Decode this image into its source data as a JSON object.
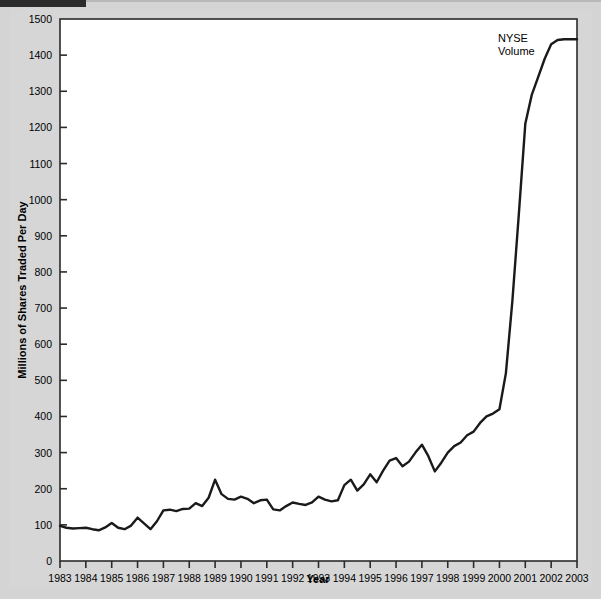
{
  "chart_data": {
    "type": "line",
    "title": "",
    "xlabel": "Year",
    "ylabel": "Millions of Shares Traded Per Day",
    "xlim": [
      1983,
      2003
    ],
    "ylim": [
      0,
      1500
    ],
    "grid": false,
    "legend_position": "inside-top-right",
    "y_ticks": [
      0,
      100,
      200,
      300,
      400,
      500,
      600,
      700,
      800,
      900,
      1000,
      1100,
      1200,
      1300,
      1400,
      1500
    ],
    "y_tick_labels": [
      "0",
      "100",
      "200",
      "300",
      "400",
      "500",
      "600",
      "700",
      "800",
      "900",
      "1000",
      "1100",
      "1200",
      "1300",
      "1400",
      "1500"
    ],
    "x_ticks": [
      1983,
      1984,
      1985,
      1986,
      1987,
      1988,
      1989,
      1990,
      1991,
      1992,
      1993,
      1994,
      1995,
      1996,
      1997,
      1998,
      1999,
      2000,
      2001,
      2002,
      2003
    ],
    "x_tick_labels": [
      "1983",
      "1984",
      "1985",
      "1986",
      "1987",
      "1988",
      "1989",
      "1990",
      "1991",
      "1992",
      "1993",
      "1994",
      "1995",
      "1996",
      "1997",
      "1998",
      "1999",
      "2000",
      "2001",
      "2002",
      "2003"
    ],
    "series": [
      {
        "name": "NYSE Volume",
        "annotation": "NYSE\nVolume",
        "annotation_lines": [
          "NYSE",
          "Volume"
        ],
        "color": "#1a1a1a",
        "x": [
          1983.0,
          1983.25,
          1983.5,
          1983.75,
          1984.0,
          1984.25,
          1984.5,
          1984.75,
          1985.0,
          1985.25,
          1985.5,
          1985.75,
          1986.0,
          1986.25,
          1986.5,
          1986.75,
          1987.0,
          1987.25,
          1987.5,
          1987.75,
          1988.0,
          1988.25,
          1988.5,
          1988.75,
          1989.0,
          1989.25,
          1989.5,
          1989.75,
          1990.0,
          1990.25,
          1990.5,
          1990.75,
          1991.0,
          1991.25,
          1991.5,
          1991.75,
          1992.0,
          1992.25,
          1992.5,
          1992.75,
          1993.0,
          1993.25,
          1993.5,
          1993.75,
          1994.0,
          1994.25,
          1994.5,
          1994.75,
          1995.0,
          1995.25,
          1995.5,
          1995.75,
          1996.0,
          1996.25,
          1996.5,
          1996.75,
          1997.0,
          1997.25,
          1997.5,
          1997.75,
          1998.0,
          1998.25,
          1998.5,
          1998.75,
          1999.0,
          1999.25,
          1999.5,
          1999.75,
          2000.0,
          2000.25,
          2000.5,
          2000.75,
          2001.0,
          2001.25,
          2001.5,
          2001.75,
          2002.0,
          2002.25,
          2002.5,
          2002.75,
          2003.0
        ],
        "y": [
          97,
          92,
          90,
          91,
          92,
          88,
          85,
          93,
          105,
          92,
          88,
          98,
          120,
          104,
          88,
          110,
          140,
          142,
          138,
          144,
          145,
          160,
          152,
          175,
          225,
          185,
          172,
          170,
          178,
          172,
          160,
          168,
          170,
          143,
          140,
          152,
          162,
          158,
          155,
          162,
          178,
          170,
          165,
          168,
          210,
          225,
          195,
          212,
          240,
          218,
          250,
          278,
          285,
          262,
          275,
          300,
          322,
          290,
          248,
          272,
          300,
          318,
          328,
          348,
          358,
          382,
          400,
          408,
          420,
          520,
          720,
          960,
          1210,
          1290,
          1340,
          1390,
          1430,
          1442,
          1444,
          1444,
          1444
        ]
      }
    ]
  },
  "axes": {
    "y_axis_title": "Millions of Shares Traded Per Day",
    "x_axis_title": "Year"
  },
  "annotations": {
    "series_label_line1": "NYSE",
    "series_label_line2": "Volume"
  },
  "colors": {
    "background": "#d6d6d6",
    "plot_background": "#ffffff",
    "line": "#1a1a1a",
    "axis": "#2b2b2b",
    "text": "#000000"
  }
}
